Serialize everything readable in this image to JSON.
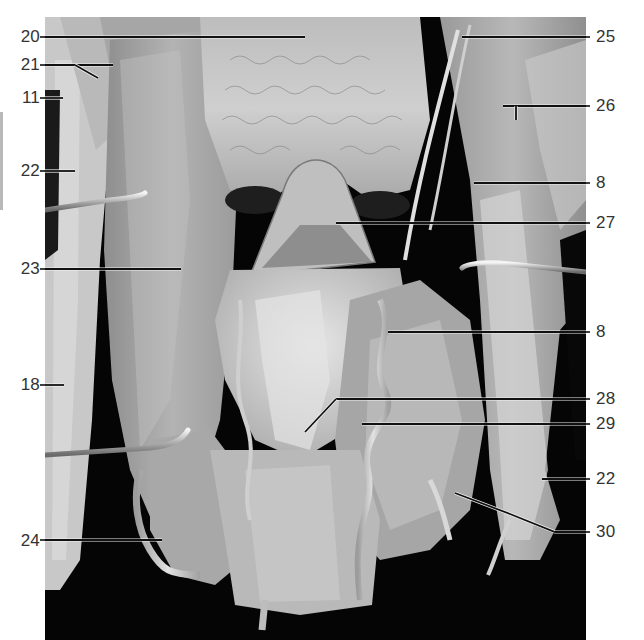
{
  "figure": {
    "type": "anatomical-photograph",
    "photo_bounds": {
      "x": 45,
      "y": 17,
      "width": 541,
      "height": 623
    },
    "colors": {
      "background": "#ffffff",
      "photo_backdrop": "#050505",
      "tissue_light": "#d6d6d6",
      "tissue_mid": "#a8a8a8",
      "tissue_dark": "#5a5a5a",
      "leader_line_dark": "#111111",
      "leader_line_light": "#f2f2f2",
      "label_text": "#333333",
      "side_bar": "#b8b8b8"
    }
  },
  "labels": {
    "left": [
      {
        "id": "l20",
        "text": "20",
        "y": 37
      },
      {
        "id": "l21",
        "text": "21",
        "y": 65
      },
      {
        "id": "l11",
        "text": "11",
        "y": 98
      },
      {
        "id": "l22a",
        "text": "22",
        "y": 171
      },
      {
        "id": "l23",
        "text": "23",
        "y": 269
      },
      {
        "id": "l18",
        "text": "18",
        "y": 385
      },
      {
        "id": "l24",
        "text": "24",
        "y": 541
      }
    ],
    "right": [
      {
        "id": "r25",
        "text": "25",
        "y": 37
      },
      {
        "id": "r26",
        "text": "26",
        "y": 106
      },
      {
        "id": "r8a",
        "text": "8",
        "y": 183
      },
      {
        "id": "r27",
        "text": "27",
        "y": 223
      },
      {
        "id": "r8b",
        "text": "8",
        "y": 332
      },
      {
        "id": "r28",
        "text": "28",
        "y": 399
      },
      {
        "id": "r29",
        "text": "29",
        "y": 424
      },
      {
        "id": "r22b",
        "text": "22",
        "y": 479
      },
      {
        "id": "r30",
        "text": "30",
        "y": 532
      }
    ]
  },
  "leader_lines": [
    {
      "label": "20",
      "points": [
        [
          45,
          37
        ],
        [
          305,
          37
        ]
      ]
    },
    {
      "label": "21",
      "points": [
        [
          45,
          65
        ],
        [
          113,
          65
        ]
      ],
      "branch": [
        [
          75,
          65
        ],
        [
          98,
          78
        ]
      ]
    },
    {
      "label": "11",
      "points": [
        [
          45,
          98
        ],
        [
          63,
          98
        ]
      ]
    },
    {
      "label": "22",
      "points": [
        [
          45,
          171
        ],
        [
          75,
          171
        ]
      ]
    },
    {
      "label": "23",
      "points": [
        [
          45,
          269
        ],
        [
          181,
          269
        ]
      ]
    },
    {
      "label": "18",
      "points": [
        [
          45,
          385
        ],
        [
          64,
          385
        ]
      ]
    },
    {
      "label": "24",
      "points": [
        [
          45,
          540
        ],
        [
          162,
          540
        ]
      ]
    },
    {
      "label": "25",
      "points": [
        [
          462,
          37
        ],
        [
          586,
          37
        ]
      ]
    },
    {
      "label": "26",
      "points": [
        [
          503,
          106
        ],
        [
          586,
          106
        ]
      ],
      "branch": [
        [
          516,
          106
        ],
        [
          516,
          120
        ]
      ]
    },
    {
      "label": "8",
      "points": [
        [
          474,
          183
        ],
        [
          586,
          183
        ]
      ]
    },
    {
      "label": "27",
      "points": [
        [
          336,
          223
        ],
        [
          586,
          223
        ]
      ]
    },
    {
      "label": "8",
      "points": [
        [
          388,
          332
        ],
        [
          586,
          332
        ]
      ]
    },
    {
      "label": "28",
      "points": [
        [
          336,
          399
        ],
        [
          586,
          399
        ]
      ],
      "branch": [
        [
          336,
          399
        ],
        [
          305,
          432
        ]
      ]
    },
    {
      "label": "29",
      "points": [
        [
          362,
          424
        ],
        [
          586,
          424
        ]
      ]
    },
    {
      "label": "22",
      "points": [
        [
          542,
          479
        ],
        [
          586,
          479
        ]
      ]
    },
    {
      "label": "30",
      "points": [
        [
          455,
          493
        ],
        [
          510,
          514
        ],
        [
          555,
          532
        ],
        [
          586,
          532
        ]
      ]
    }
  ]
}
